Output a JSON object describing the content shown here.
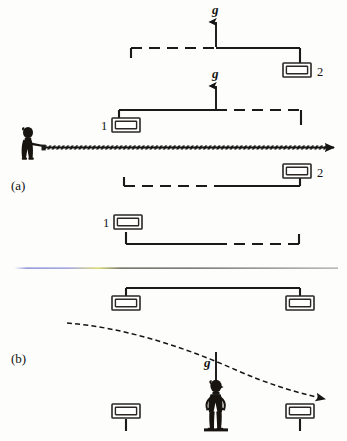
{
  "figure": {
    "background_color": "#fdfdfb",
    "ink_color": "#1a1a18"
  },
  "panels": [
    {
      "id": "a",
      "label": "(a)",
      "description": "Observer in an accelerating elevator emits a horizontal light beam; successive positions of the elevator are shown displaced upward.",
      "gravity_labels": [
        {
          "text": "g",
          "direction": "up"
        },
        {
          "text": "g",
          "direction": "up"
        }
      ],
      "detector_labels": [
        {
          "text": "2",
          "position": "upper-right"
        },
        {
          "text": "1",
          "position": "middle-left"
        },
        {
          "text": "2",
          "position": "lower-right"
        },
        {
          "text": "1",
          "position": "bottom-left"
        }
      ],
      "beam": {
        "type": "light-beam",
        "direction": "right",
        "style": "hatched-straight"
      }
    },
    {
      "id": "b",
      "label": "(b)",
      "description": "Observer at rest in a gravitational field; the light beam follows a downward curved path.",
      "gravity_labels": [
        {
          "text": "g",
          "direction": "down"
        }
      ],
      "detector_labels": [],
      "beam": {
        "type": "light-beam",
        "direction": "right-downward",
        "style": "curved-dashed"
      }
    }
  ],
  "divider": {
    "name": "panel-divider",
    "gradient_stops": [
      "#8f92d8",
      "#d9d86a",
      "#6f6f6f",
      "#9a9a9a"
    ]
  },
  "colors": {
    "ink": "#1a1a18",
    "paper": "#fdfdfb",
    "divider_blue": "#8f92d8",
    "divider_yellow": "#d9d86a",
    "divider_gray": "#6f6f6f"
  }
}
